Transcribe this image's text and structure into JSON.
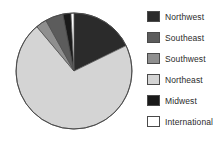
{
  "chart_data": {
    "type": "pie",
    "title": "",
    "legend_position": "right",
    "start_angle_deg": 0,
    "direction": "clockwise",
    "categories": [
      "Northwest",
      "Southeast",
      "Southwest",
      "Northeast",
      "Midwest",
      "International"
    ],
    "slice_order_clockwise_from_top": [
      "Northwest",
      "Northeast",
      "Southwest",
      "Southeast",
      "Midwest",
      "International"
    ],
    "values": [
      18,
      5,
      3,
      71,
      2,
      1
    ],
    "slices": [
      {
        "label": "Northwest",
        "value": 18,
        "angle_deg": 64,
        "color": "#2b2b2b"
      },
      {
        "label": "Northeast",
        "value": 71,
        "angle_deg": 256,
        "color": "#d4d4d4"
      },
      {
        "label": "Southwest",
        "value": 3,
        "angle_deg": 11,
        "color": "#8f8f8f"
      },
      {
        "label": "Southeast",
        "value": 5,
        "angle_deg": 18,
        "color": "#5c5c5c"
      },
      {
        "label": "Midwest",
        "value": 2,
        "angle_deg": 8,
        "color": "#1a1a1a"
      },
      {
        "label": "International",
        "value": 1,
        "angle_deg": 3,
        "color": "#ffffff"
      }
    ],
    "xlabel": "",
    "ylabel": ""
  },
  "legend": {
    "items": [
      {
        "label": "Northwest",
        "color": "#2b2b2b"
      },
      {
        "label": "Southeast",
        "color": "#5c5c5c"
      },
      {
        "label": "Southwest",
        "color": "#8f8f8f"
      },
      {
        "label": "Northeast",
        "color": "#d4d4d4"
      },
      {
        "label": "Midwest",
        "color": "#1a1a1a"
      },
      {
        "label": "International",
        "color": "#ffffff"
      }
    ]
  },
  "pie_geometry": {
    "center_x": 74,
    "center_y": 71,
    "radius": 58
  },
  "colors": {
    "outline": "#4a4a4a",
    "background": "#ffffff",
    "text": "#2b2b2b"
  }
}
